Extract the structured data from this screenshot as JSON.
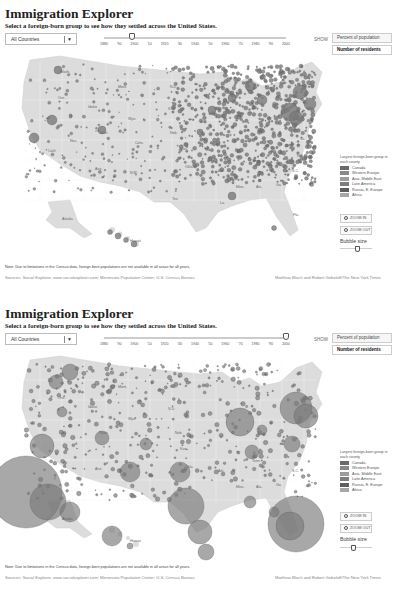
{
  "panels": [
    {
      "title": "Immigration Explorer",
      "subtitle": "Select a foreign-born group to see how they settled across the United States.",
      "country_select": {
        "value": "All Countries",
        "arrow": "▼"
      },
      "timeline": {
        "labels": [
          "1880",
          "'90",
          "1900",
          "'10",
          "1920",
          "'30",
          "1940",
          "'50",
          "1960",
          "'70",
          "1980",
          "'90",
          "2000"
        ],
        "selected_year": "1900",
        "thumb_pct": 17
      },
      "show": {
        "label": "SHOW",
        "options": [
          "Percent of population",
          "Number of residents"
        ],
        "selected": "Number of residents"
      },
      "map": {
        "state_labels": [
          {
            "t": "Wash.",
            "x": 60,
            "y": 21
          },
          {
            "t": "Mont.",
            "x": 118,
            "y": 36
          },
          {
            "t": "Ore.",
            "x": 58,
            "y": 47
          },
          {
            "t": "Idaho",
            "x": 88,
            "y": 56
          },
          {
            "t": "N.D.",
            "x": 170,
            "y": 36
          },
          {
            "t": "Wyo.",
            "x": 128,
            "y": 68
          },
          {
            "t": "S.D.",
            "x": 168,
            "y": 58
          },
          {
            "t": "Nev.",
            "x": 70,
            "y": 90
          },
          {
            "t": "Utah",
            "x": 100,
            "y": 82
          },
          {
            "t": "Colo.",
            "x": 135,
            "y": 92
          },
          {
            "t": "Neb.",
            "x": 170,
            "y": 82
          },
          {
            "t": "Calif.",
            "x": 48,
            "y": 100
          },
          {
            "t": "Ariz.",
            "x": 95,
            "y": 118
          },
          {
            "t": "N.M.",
            "x": 130,
            "y": 122
          },
          {
            "t": "Kan.",
            "x": 180,
            "y": 98
          },
          {
            "t": "Okla.",
            "x": 185,
            "y": 116
          },
          {
            "t": "Tex.",
            "x": 172,
            "y": 148
          },
          {
            "t": "Ark.",
            "x": 218,
            "y": 120
          },
          {
            "t": "Tenn.",
            "x": 252,
            "y": 110
          },
          {
            "t": "Miss.",
            "x": 236,
            "y": 136
          },
          {
            "t": "Ala.",
            "x": 256,
            "y": 136
          },
          {
            "t": "Ga.",
            "x": 276,
            "y": 134
          },
          {
            "t": "S.C.",
            "x": 292,
            "y": 120
          },
          {
            "t": "N.C.",
            "x": 297,
            "y": 105
          },
          {
            "t": "Va.",
            "x": 300,
            "y": 88
          },
          {
            "t": "La.",
            "x": 220,
            "y": 152
          },
          {
            "t": "Fla.",
            "x": 293,
            "y": 164
          },
          {
            "t": "Alaska",
            "x": 62,
            "y": 168
          },
          {
            "t": "Hawaii",
            "x": 130,
            "y": 190
          }
        ]
      },
      "legend": {
        "title": "Largest foreign-born group in each county",
        "items": [
          {
            "label": "Canada",
            "color": "#6a6a6a"
          },
          {
            "label": "Western Europe",
            "color": "#888888"
          },
          {
            "label": "Asia, Middle East",
            "color": "#9c9c9c"
          },
          {
            "label": "Latin America",
            "color": "#7e7e7e"
          },
          {
            "label": "Russia, E. Europe",
            "color": "#5e5e5e"
          },
          {
            "label": "Africa",
            "color": "#a6a6a6"
          }
        ]
      },
      "zoom_in": "ZOOM IN",
      "zoom_out": "ZOOM OUT",
      "bubble_size": {
        "label": "Bubble size",
        "thumb_pct": 55
      },
      "note": "Note: Due to limitations in the Census data, foreign-born populations are not available in all areas for all years.",
      "sources": "Sources: Social Explorer, www.socialexplorer.com; Minnesota Population Center; U.S. Census Bureau",
      "credit": "Matthew Bloch and Robert Gebeloff/The New York Times"
    },
    {
      "title": "Immigration Explorer",
      "subtitle": "Select a foreign-born group to see how they settled across the United States.",
      "country_select": {
        "value": "All Countries",
        "arrow": "▼"
      },
      "timeline": {
        "labels": [
          "1880",
          "'90",
          "1900",
          "'10",
          "1920",
          "'30",
          "1940",
          "'50",
          "1960",
          "'70",
          "1980",
          "'90",
          "2000"
        ],
        "selected_year": "2000",
        "thumb_pct": 98
      },
      "show": {
        "label": "SHOW",
        "options": [
          "Percent of population",
          "Number of residents"
        ],
        "selected": "Number of residents"
      },
      "map": {
        "state_labels": [
          {
            "t": "Mont.",
            "x": 118,
            "y": 36
          },
          {
            "t": "N.D.",
            "x": 170,
            "y": 36
          },
          {
            "t": "Ore.",
            "x": 58,
            "y": 47
          },
          {
            "t": "Idaho",
            "x": 88,
            "y": 56
          },
          {
            "t": "S.D.",
            "x": 168,
            "y": 58
          },
          {
            "t": "Wyo.",
            "x": 128,
            "y": 68
          },
          {
            "t": "Utah",
            "x": 100,
            "y": 82
          },
          {
            "t": "Neb.",
            "x": 175,
            "y": 82
          },
          {
            "t": "Ariz.",
            "x": 95,
            "y": 118
          },
          {
            "t": "Kan.",
            "x": 180,
            "y": 98
          },
          {
            "t": "Okla.",
            "x": 185,
            "y": 116
          },
          {
            "t": "Ark.",
            "x": 218,
            "y": 120
          },
          {
            "t": "Tenn.",
            "x": 252,
            "y": 110
          },
          {
            "t": "Miss.",
            "x": 236,
            "y": 136
          },
          {
            "t": "Ala.",
            "x": 256,
            "y": 136
          },
          {
            "t": "Ga.",
            "x": 276,
            "y": 134
          },
          {
            "t": "S.C.",
            "x": 292,
            "y": 120
          },
          {
            "t": "Alaska",
            "x": 62,
            "y": 168
          },
          {
            "t": "Hawaii",
            "x": 130,
            "y": 190
          }
        ]
      },
      "legend": {
        "title": "Largest foreign-born group in each county",
        "items": [
          {
            "label": "Canada",
            "color": "#6a6a6a"
          },
          {
            "label": "Western Europe",
            "color": "#888888"
          },
          {
            "label": "Asia, Middle East",
            "color": "#9c9c9c"
          },
          {
            "label": "Latin America",
            "color": "#7e7e7e"
          },
          {
            "label": "Russia, E. Europe",
            "color": "#5e5e5e"
          },
          {
            "label": "Africa",
            "color": "#a6a6a6"
          }
        ]
      },
      "zoom_in": "ZOOM IN",
      "zoom_out": "ZOOM OUT",
      "bubble_size": {
        "label": "Bubble size",
        "thumb_pct": 45
      },
      "note": "Note: Due to limitations in the Census data, foreign-born populations are not available in all areas for all years.",
      "sources": "Sources: Social Explorer, www.socialexplorer.com; Minnesota Population Center; U.S. Census Bureau",
      "credit": "Matthew Bloch and Robert Gebeloff/The New York Times"
    }
  ],
  "colors": {
    "land": "#dcdcdc",
    "land_border": "#f2f2f2",
    "bubble_fill": "#7a7a7a",
    "bubble_stroke": "#5a5a5a"
  }
}
